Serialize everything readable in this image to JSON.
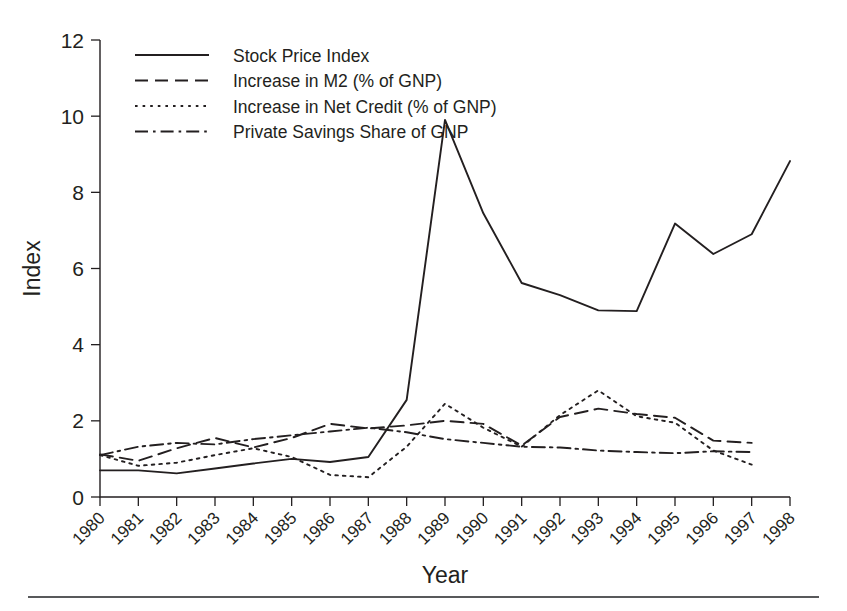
{
  "figure": {
    "background": "#ffffff",
    "ink_color": "#231f20"
  },
  "axes": {
    "ylabel": "Index",
    "xlabel": "Year",
    "y_ticks": [
      "0",
      "2",
      "4",
      "6",
      "8",
      "10",
      "12"
    ],
    "x_ticks": [
      "1980",
      "1981",
      "1982",
      "1983",
      "1984",
      "1985",
      "1986",
      "1987",
      "1988",
      "1989",
      "1990",
      "1991",
      "1992",
      "1993",
      "1994",
      "1995",
      "1996",
      "1997",
      "1998"
    ]
  },
  "legend": {
    "position": "top-left-inside",
    "entries": [
      {
        "label": "Stock Price Index",
        "style": "solid"
      },
      {
        "label": "Increase in M2 (% of GNP)",
        "style": "dashed"
      },
      {
        "label": "Increase in Net Credit (% of GNP)",
        "style": "dotted"
      },
      {
        "label": "Private Savings Share of GNP",
        "style": "dashdot"
      }
    ]
  },
  "chart_data": {
    "type": "line",
    "title": "",
    "xlabel": "Year",
    "ylabel": "Index",
    "xlim": [
      1980,
      1998
    ],
    "ylim": [
      0,
      12
    ],
    "grid": false,
    "legend_position": "upper left",
    "x": [
      1980,
      1981,
      1982,
      1983,
      1984,
      1985,
      1986,
      1987,
      1988,
      1989,
      1990,
      1991,
      1992,
      1993,
      1994,
      1995,
      1996,
      1997,
      1998
    ],
    "series": [
      {
        "name": "Stock Price Index",
        "style": "solid",
        "x": [
          1980,
          1981,
          1982,
          1983,
          1984,
          1985,
          1986,
          1987,
          1988,
          1989,
          1990,
          1991,
          1992,
          1993,
          1994,
          1995,
          1996,
          1997,
          1998
        ],
        "values": [
          0.7,
          0.7,
          0.62,
          0.75,
          0.88,
          1.0,
          0.92,
          1.05,
          2.55,
          9.9,
          7.45,
          5.62,
          5.3,
          4.9,
          4.88,
          7.18,
          6.38,
          6.9,
          8.82
        ]
      },
      {
        "name": "Increase in M2 (% of GNP)",
        "style": "dashed",
        "x": [
          1980,
          1981,
          1982,
          1983,
          1984,
          1985,
          1986,
          1987,
          1988,
          1989,
          1990,
          1991,
          1992,
          1993,
          1994,
          1995,
          1996,
          1997
        ],
        "values": [
          1.12,
          0.95,
          1.28,
          1.55,
          1.3,
          1.55,
          1.92,
          1.8,
          1.88,
          2.0,
          1.92,
          1.35,
          2.1,
          2.32,
          2.18,
          2.08,
          1.48,
          1.42
        ]
      },
      {
        "name": "Increase in Net Credit (% of GNP)",
        "style": "dotted",
        "x": [
          1980,
          1981,
          1982,
          1983,
          1984,
          1985,
          1986,
          1987,
          1988,
          1989,
          1990,
          1991,
          1992,
          1993,
          1994,
          1995,
          1996,
          1997
        ],
        "values": [
          1.1,
          0.82,
          0.9,
          1.1,
          1.28,
          1.05,
          0.58,
          0.52,
          1.32,
          2.45,
          1.82,
          1.32,
          2.15,
          2.8,
          2.12,
          1.95,
          1.22,
          0.85
        ]
      },
      {
        "name": "Private Savings Share of GNP",
        "style": "dashdot",
        "x": [
          1980,
          1981,
          1982,
          1983,
          1984,
          1985,
          1986,
          1987,
          1988,
          1989,
          1990,
          1991,
          1992,
          1993,
          1994,
          1995,
          1996,
          1997
        ],
        "values": [
          1.1,
          1.32,
          1.42,
          1.38,
          1.52,
          1.62,
          1.72,
          1.82,
          1.7,
          1.52,
          1.42,
          1.32,
          1.3,
          1.22,
          1.18,
          1.15,
          1.2,
          1.18
        ]
      }
    ]
  }
}
